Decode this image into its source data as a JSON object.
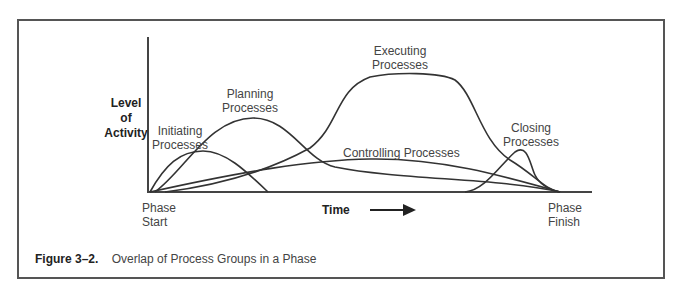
{
  "figure": {
    "caption_number": "Figure 3–2.",
    "caption_text": "Overlap of Process Groups in a Phase"
  },
  "axes": {
    "y_label_lines": [
      "Level",
      "of",
      "Activity"
    ],
    "x_label": "Time",
    "x_start_lines": [
      "Phase",
      "Start"
    ],
    "x_end_lines": [
      "Phase",
      "Finish"
    ]
  },
  "curves": [
    {
      "id": "initiating",
      "label_lines": [
        "Initiating",
        "Processes"
      ]
    },
    {
      "id": "planning",
      "label_lines": [
        "Planning",
        "Processes"
      ]
    },
    {
      "id": "executing",
      "label_lines": [
        "Executing",
        "Processes"
      ]
    },
    {
      "id": "controlling",
      "label_lines": [
        "Controlling Processes"
      ]
    },
    {
      "id": "closing",
      "label_lines": [
        "Closing",
        "Processes"
      ]
    }
  ],
  "colors": {
    "line": "#333333",
    "frame": "#555555"
  }
}
